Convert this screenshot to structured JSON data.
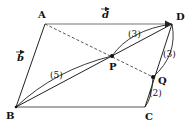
{
  "figure": {
    "type": "parallelogram-vector-diagram",
    "points": {
      "A": {
        "label": "A",
        "x": 45,
        "y": 24
      },
      "D": {
        "label": "D",
        "x": 172,
        "y": 24
      },
      "B": {
        "label": "B",
        "x": 16,
        "y": 107
      },
      "C": {
        "label": "C",
        "x": 145,
        "y": 107
      },
      "P": {
        "label": "P",
        "x": 112,
        "y": 56
      },
      "Q": {
        "label": "Q",
        "x": 153,
        "y": 77
      }
    },
    "vectors": {
      "d": {
        "label": "d",
        "from": "A",
        "to": "D"
      },
      "b": {
        "label": "b",
        "from": "A",
        "to": "B"
      }
    },
    "ratios": {
      "BP": "(5)",
      "PD": "(3)",
      "DQ": "(3)",
      "QC": "(2)"
    },
    "segments": [
      {
        "from": "A",
        "to": "D",
        "style": "solid"
      },
      {
        "from": "A",
        "to": "B",
        "style": "solid"
      },
      {
        "from": "B",
        "to": "C",
        "style": "solid"
      },
      {
        "from": "C",
        "to": "D",
        "style": "solid"
      },
      {
        "from": "B",
        "to": "D",
        "style": "solid"
      },
      {
        "from": "A",
        "to": "Q",
        "style": "dashed"
      }
    ],
    "colors": {
      "line": "#222222",
      "background": "#ffffff"
    }
  }
}
